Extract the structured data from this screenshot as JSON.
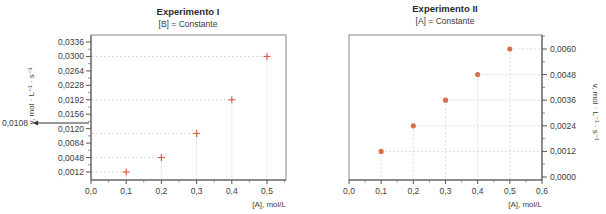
{
  "chart_data": [
    {
      "type": "scatter",
      "title": "Experimento I",
      "subtitle": "[B] = Constante",
      "xlabel": "[A], mol/L",
      "ylabel": "v, mol · L⁻¹ · s⁻¹",
      "x_ticks": [
        "0,0",
        "0,1",
        "0,2",
        "0,3",
        "0,4",
        "0,5"
      ],
      "y_ticks": [
        "0,0012",
        "0,0048",
        "0,0084",
        "0,0120",
        "0,0156",
        "0,0192",
        "0,0228",
        "0,0264",
        "0,0300",
        "0,0336"
      ],
      "xlim": [
        0,
        0.55
      ],
      "ylim": [
        0,
        0.0345
      ],
      "marker": "plus",
      "marker_color": "#d9604a",
      "grid": "dashed guide lines to points",
      "annotation": {
        "text": "0,0108",
        "value": 0.0108,
        "style": "arrow pointing left"
      },
      "x": [
        0.1,
        0.2,
        0.3,
        0.4,
        0.5
      ],
      "values": [
        0.0012,
        0.0048,
        0.0108,
        0.0192,
        0.03
      ]
    },
    {
      "type": "scatter",
      "title": "Experimento II",
      "subtitle": "[A] = Constante",
      "xlabel": "[A], mol/L",
      "ylabel": "v, mol · L⁻¹ · s⁻¹",
      "x_ticks": [
        "0,0",
        "0,1",
        "0,2",
        "0,3",
        "0,4",
        "0,5",
        "0,6"
      ],
      "y_ticks": [
        "0,0000",
        "0,0012",
        "0,0024",
        "0,0036",
        "0,0048",
        "0,0060"
      ],
      "xlim": [
        0,
        0.6
      ],
      "ylim": [
        0,
        0.0064
      ],
      "y_axis_position": "right",
      "marker": "dot",
      "marker_color": "#d9704e",
      "grid": "dashed guide lines to points",
      "x": [
        0.1,
        0.2,
        0.3,
        0.4,
        0.5
      ],
      "values": [
        0.0012,
        0.0024,
        0.0036,
        0.0048,
        0.006
      ]
    }
  ]
}
